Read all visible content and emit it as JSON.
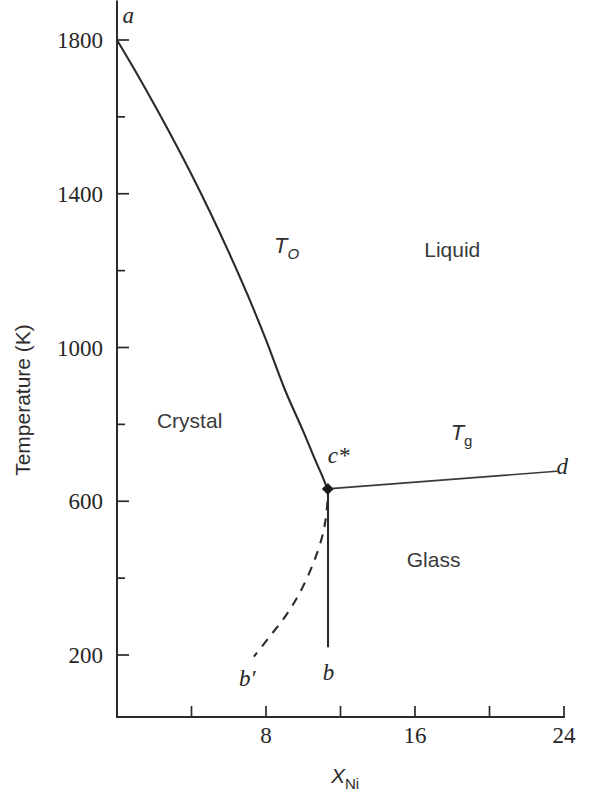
{
  "chart_data": {
    "type": "line",
    "title": "",
    "xlabel": "X_Ni",
    "xlabel_base": "X",
    "xlabel_sub": "Ni",
    "ylabel": "Temperature (K)",
    "xlim": [
      0,
      24
    ],
    "ylim": [
      0,
      1900
    ],
    "grid": false,
    "legend": "none",
    "x_ticks_major": [
      8,
      16,
      24
    ],
    "x_ticks_minor": [
      4,
      12,
      20
    ],
    "x_tick_labels": [
      "8",
      "16",
      "24"
    ],
    "y_ticks_major": [
      1800,
      1400,
      1000,
      600,
      200
    ],
    "y_ticks_minor": [
      1600,
      1200,
      800,
      400
    ],
    "y_tick_labels": [
      "1800",
      "1400",
      "1000",
      "600",
      "200"
    ],
    "annotations": [
      {
        "name": "point-a",
        "text": "a",
        "x": 0.6,
        "y": 1845,
        "italic": true
      },
      {
        "name": "point-b",
        "text": "b",
        "x": 11.35,
        "y": 135,
        "italic": true
      },
      {
        "name": "point-b-prime",
        "text": "b′",
        "x": 7.0,
        "y": 120,
        "italic": true
      },
      {
        "name": "point-c-star",
        "text": "c*",
        "x": 11.9,
        "y": 700,
        "italic": true
      },
      {
        "name": "point-d",
        "text": "d",
        "x": 23.9,
        "y": 672,
        "italic": true
      },
      {
        "name": "curve-label-T-zero",
        "text": "T_O",
        "x": 9.1,
        "y": 1245,
        "italic": true
      },
      {
        "name": "curve-label-T-g",
        "text": "T_g",
        "x": 18.5,
        "y": 760,
        "italic": true
      },
      {
        "name": "region-liquid",
        "text": "Liquid",
        "x": 18.0,
        "y": 1235,
        "italic": false
      },
      {
        "name": "region-crystal",
        "text": "Crystal",
        "x": 3.9,
        "y": 790,
        "italic": false
      },
      {
        "name": "region-glass",
        "text": "Glass",
        "x": 17.0,
        "y": 430,
        "italic": false
      }
    ],
    "series": [
      {
        "name": "T_O",
        "label": "T_O",
        "style": "solid",
        "description": "Equal free-energy (T-zero) boundary from point a to point c*",
        "points": [
          {
            "x": 0.0,
            "y": 1800
          },
          {
            "x": 1.0,
            "y": 1718
          },
          {
            "x": 2.0,
            "y": 1632
          },
          {
            "x": 3.0,
            "y": 1543
          },
          {
            "x": 4.0,
            "y": 1450
          },
          {
            "x": 5.0,
            "y": 1352
          },
          {
            "x": 6.0,
            "y": 1248
          },
          {
            "x": 7.0,
            "y": 1138
          },
          {
            "x": 8.0,
            "y": 1020
          },
          {
            "x": 9.0,
            "y": 892
          },
          {
            "x": 10.0,
            "y": 782
          },
          {
            "x": 10.6,
            "y": 712
          },
          {
            "x": 11.0,
            "y": 668
          },
          {
            "x": 11.3,
            "y": 632
          }
        ]
      },
      {
        "name": "T_g",
        "label": "T_g",
        "style": "solid",
        "description": "Glass transition temperature line from c* to d",
        "points": [
          {
            "x": 11.3,
            "y": 632
          },
          {
            "x": 23.6,
            "y": 678
          }
        ]
      },
      {
        "name": "vertical-b-line",
        "label": "b",
        "style": "solid",
        "description": "Vertical metastable composition line from c* down to b",
        "points": [
          {
            "x": 11.33,
            "y": 632
          },
          {
            "x": 11.33,
            "y": 222
          }
        ]
      },
      {
        "name": "dashed-b-prime",
        "label": "b′",
        "style": "dashed",
        "description": "Dashed metastable extension from c* region down to b-prime",
        "points": [
          {
            "x": 11.3,
            "y": 600
          },
          {
            "x": 11.2,
            "y": 552
          },
          {
            "x": 11.0,
            "y": 505
          },
          {
            "x": 10.55,
            "y": 440
          },
          {
            "x": 9.9,
            "y": 370
          },
          {
            "x": 9.1,
            "y": 305
          },
          {
            "x": 8.2,
            "y": 248
          },
          {
            "x": 7.35,
            "y": 196
          }
        ]
      }
    ],
    "markers": [
      {
        "name": "c-star-marker",
        "x": 11.32,
        "y": 632,
        "shape": "diamond",
        "color": "#1a1a1a"
      }
    ]
  },
  "colors": {
    "background": "#ffffff",
    "ink": "#2a2a2a",
    "axis": "#2a2a2a"
  }
}
